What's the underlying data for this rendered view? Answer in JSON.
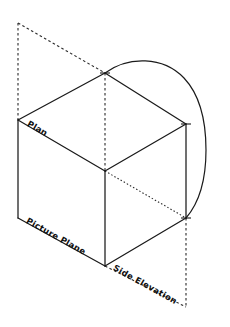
{
  "figure": {
    "background_color": "#ffffff",
    "line_color": "#1a1a1a",
    "width": 230,
    "height": 327
  },
  "labels": {
    "plan": "Plan",
    "picture_plane": "Picture Plane",
    "side_elevation": "Side Elevation"
  },
  "geometry": {
    "vertices": {
      "top_center": [
        105,
        73
      ],
      "left_upper": [
        18,
        120
      ],
      "right_upper": [
        186,
        124
      ],
      "center": [
        105,
        171
      ],
      "left_lower": [
        18,
        218
      ],
      "right_lower": [
        186,
        218
      ],
      "bottom_center": [
        105,
        266
      ],
      "dashed_top_left": [
        18,
        23
      ],
      "dashed_bottom_right": [
        186,
        307
      ]
    },
    "solid_edges": [
      [
        [
          18,
          120
        ],
        [
          105,
          73
        ]
      ],
      [
        [
          105,
          73
        ],
        [
          186,
          124
        ]
      ],
      [
        [
          18,
          120
        ],
        [
          105,
          171
        ]
      ],
      [
        [
          105,
          171
        ],
        [
          186,
          124
        ]
      ],
      [
        [
          18,
          120
        ],
        [
          18,
          218
        ]
      ],
      [
        [
          186,
          124
        ],
        [
          186,
          218
        ]
      ],
      [
        [
          105,
          171
        ],
        [
          105,
          266
        ]
      ],
      [
        [
          18,
          218
        ],
        [
          105,
          266
        ]
      ],
      [
        [
          105,
          266
        ],
        [
          186,
          218
        ]
      ]
    ],
    "dashed_edges": [
      [
        [
          18,
          23
        ],
        [
          105,
          73
        ]
      ],
      [
        [
          18,
          23
        ],
        [
          18,
          120
        ]
      ],
      [
        [
          105,
          73
        ],
        [
          105,
          171
        ]
      ],
      [
        [
          186,
          218
        ],
        [
          186,
          307
        ]
      ],
      [
        [
          105,
          266
        ],
        [
          186,
          307
        ]
      ]
    ],
    "dotted_edges": [
      [
        [
          105,
          171
        ],
        [
          186,
          218
        ]
      ]
    ],
    "curve": {
      "type": "arc",
      "start": [
        105,
        73
      ],
      "end": [
        186,
        218
      ],
      "apex": [
        150,
        60
      ],
      "max_x": 206
    },
    "tick_marks": [
      [
        105,
        73
      ],
      [
        186,
        124
      ],
      [
        186,
        218
      ]
    ]
  }
}
